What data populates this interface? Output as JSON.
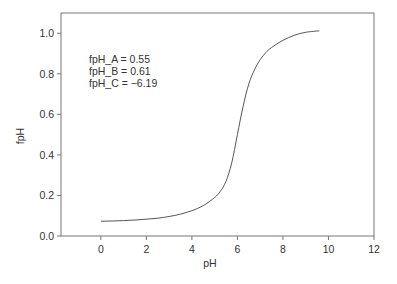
{
  "chart_data": {
    "type": "line",
    "title": "",
    "xlabel": "pH",
    "ylabel": "fpH",
    "xlim": [
      -1.75,
      12
    ],
    "ylim": [
      0.0,
      1.1
    ],
    "xticks": [
      0,
      2,
      4,
      6,
      8,
      10,
      12
    ],
    "xtick_labels": [
      "0",
      "2",
      "4",
      "6",
      "8",
      "10",
      "12"
    ],
    "yticks": [
      0.0,
      0.2,
      0.4,
      0.6,
      0.8,
      1.0
    ],
    "ytick_labels": [
      "0.0",
      "0.2",
      "0.4",
      "0.6",
      "0.8",
      "1.0"
    ],
    "grid": false,
    "legend": null,
    "annotations": [
      "fpH_A = 0.55",
      "fpH_B = 0.61",
      "fpH_C = −6.19"
    ],
    "series": [
      {
        "name": "fpH",
        "color": "#555555",
        "x": [
          0,
          0.5,
          1,
          1.5,
          2,
          2.5,
          3,
          3.5,
          4,
          4.5,
          5,
          5.25,
          5.5,
          5.75,
          6,
          6.25,
          6.5,
          6.75,
          7,
          7.25,
          7.5,
          8,
          8.5,
          9,
          9.6
        ],
        "y": [
          0.073,
          0.074,
          0.076,
          0.079,
          0.083,
          0.088,
          0.096,
          0.108,
          0.125,
          0.15,
          0.19,
          0.22,
          0.27,
          0.36,
          0.5,
          0.64,
          0.75,
          0.82,
          0.87,
          0.905,
          0.93,
          0.965,
          0.99,
          1.005,
          1.012
        ]
      }
    ]
  }
}
